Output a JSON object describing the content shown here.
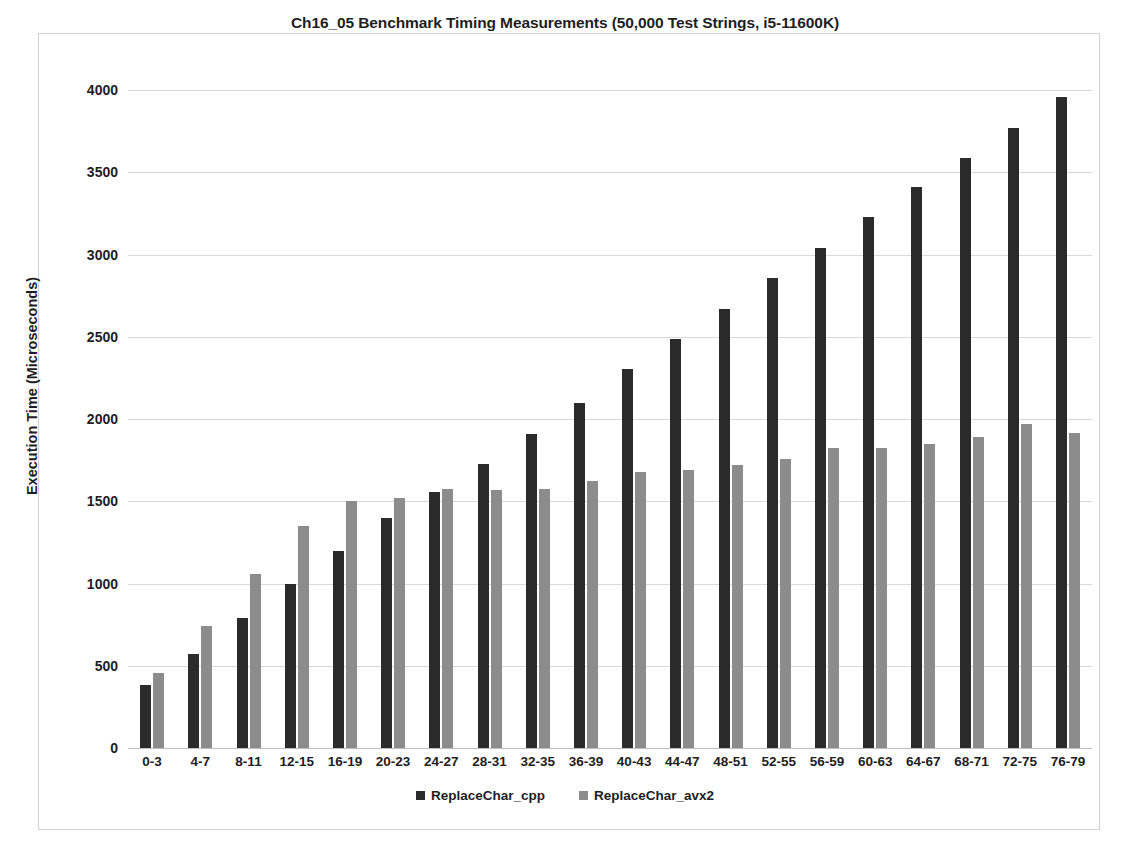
{
  "chart_data": {
    "type": "bar",
    "title": "Ch16_05 Benchmark Timing Measurements (50,000 Test Strings, i5-11600K)",
    "xlabel": "",
    "ylabel": "Execution Time (Microseconds)",
    "ylim": [
      0,
      4000
    ],
    "ytick_step": 500,
    "yticks": [
      "0",
      "500",
      "1000",
      "1500",
      "2000",
      "2500",
      "3000",
      "3500",
      "4000"
    ],
    "grid": true,
    "legend_position": "bottom",
    "categories": [
      "0-3",
      "4-7",
      "8-11",
      "12-15",
      "16-19",
      "20-23",
      "24-27",
      "28-31",
      "32-35",
      "36-39",
      "40-43",
      "44-47",
      "48-51",
      "52-55",
      "56-59",
      "60-63",
      "64-67",
      "68-71",
      "72-75",
      "76-79"
    ],
    "series": [
      {
        "name": "ReplaceChar_cpp",
        "color": "#2b2b2b",
        "values": [
          382,
          572,
          790,
          998,
          1196,
          1399,
          1556,
          1727,
          1910,
          2100,
          2303,
          2484,
          2671,
          2855,
          3042,
          3228,
          3410,
          3588,
          3772,
          3958
        ]
      },
      {
        "name": "ReplaceChar_avx2",
        "color": "#8c8c8c",
        "values": [
          458,
          744,
          1056,
          1352,
          1500,
          1520,
          1572,
          1568,
          1576,
          1626,
          1678,
          1690,
          1722,
          1756,
          1826,
          1826,
          1848,
          1890,
          1968,
          1916
        ]
      }
    ]
  },
  "legend": [
    {
      "label": "ReplaceChar_cpp",
      "swatch": "cpp"
    },
    {
      "label": "ReplaceChar_avx2",
      "swatch": "avx2"
    }
  ]
}
